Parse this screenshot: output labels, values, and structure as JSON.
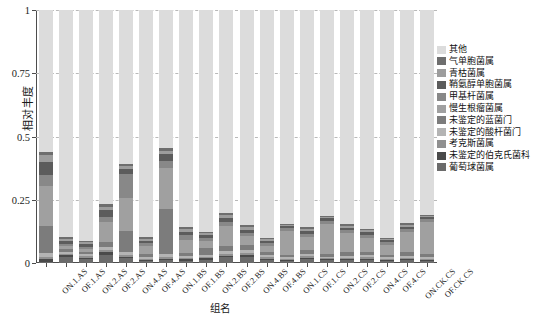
{
  "chart_data": {
    "type": "bar",
    "stacked": true,
    "title": "",
    "xlabel": "组名",
    "ylabel": "相对丰度",
    "ylim": [
      0,
      1
    ],
    "yticks": [
      0,
      0.25,
      0.5,
      0.75,
      1
    ],
    "ytick_labels": [
      "0",
      "0.25",
      "0.5",
      "0.75",
      "1"
    ],
    "grid": true,
    "grid_style": "dashed-horizontal",
    "legend_position": "right",
    "categories": [
      "ON.1.AS",
      "OF.1.AS",
      "ON.2.AS",
      "OF.2.AS",
      "ON.4.AS",
      "OF.4.AS",
      "ON.1.BS",
      "OF.1.BS",
      "ON.2.BS",
      "OF.2.BS",
      "ON.4.BS",
      "OF.4.BS",
      "ON.1.CS",
      "OF.1.CS",
      "ON.2.CS",
      "OF.2.CS",
      "ON.4.CS",
      "OF.4.CS",
      "ON.CK.CS",
      "OF.CK.CS"
    ],
    "series": [
      {
        "name": "葡萄球菌属",
        "color": "#6b6b6b",
        "values": [
          0.004,
          0.022,
          0.014,
          0.03,
          0.018,
          0.006,
          0.01,
          0.008,
          0.012,
          0.022,
          0.024,
          0.01,
          0.008,
          0.014,
          0.01,
          0.01,
          0.01,
          0.008,
          0.01,
          0.008
        ]
      },
      {
        "name": "未鉴定的伯克氏菌科",
        "color": "#4a4a4a",
        "values": [
          0.01,
          0.008,
          0.006,
          0.012,
          0.006,
          0.004,
          0.006,
          0.006,
          0.006,
          0.006,
          0.008,
          0.006,
          0.004,
          0.006,
          0.004,
          0.004,
          0.006,
          0.004,
          0.004,
          0.004
        ]
      },
      {
        "name": "考克斯菌属",
        "color": "#909090",
        "values": [
          0.01,
          0.006,
          0.006,
          0.01,
          0.008,
          0.006,
          0.008,
          0.006,
          0.006,
          0.008,
          0.008,
          0.006,
          0.004,
          0.006,
          0.004,
          0.006,
          0.006,
          0.004,
          0.006,
          0.004
        ]
      },
      {
        "name": "未鉴定的酸杆菌门",
        "color": "#b4b4b4",
        "values": [
          0.016,
          0.008,
          0.008,
          0.012,
          0.01,
          0.008,
          0.01,
          0.008,
          0.008,
          0.01,
          0.01,
          0.008,
          0.006,
          0.008,
          0.006,
          0.008,
          0.008,
          0.006,
          0.008,
          0.006
        ]
      },
      {
        "name": "未鉴定的蓝菌门",
        "color": "#7c7c7c",
        "values": [
          0.105,
          0.01,
          0.008,
          0.02,
          0.084,
          0.012,
          0.18,
          0.012,
          0.026,
          0.02,
          0.02,
          0.014,
          0.01,
          0.016,
          0.012,
          0.014,
          0.014,
          0.01,
          0.014,
          0.012
        ]
      },
      {
        "name": "慢生根瘤菌属",
        "color": "#a0a0a0",
        "values": [
          0.16,
          0.012,
          0.014,
          0.078,
          0.13,
          0.03,
          0.162,
          0.052,
          0.028,
          0.08,
          0.036,
          0.024,
          0.095,
          0.052,
          0.12,
          0.075,
          0.055,
          0.04,
          0.08,
          0.13
        ]
      },
      {
        "name": "甲基杆菌属",
        "color": "#888888",
        "values": [
          0.045,
          0.008,
          0.008,
          0.022,
          0.096,
          0.012,
          0.028,
          0.018,
          0.014,
          0.018,
          0.014,
          0.01,
          0.01,
          0.014,
          0.012,
          0.012,
          0.012,
          0.01,
          0.012,
          0.01
        ]
      },
      {
        "name": "鞘氨醇单胞菌属",
        "color": "#5c5c5c",
        "values": [
          0.05,
          0.014,
          0.01,
          0.024,
          0.018,
          0.01,
          0.026,
          0.014,
          0.01,
          0.016,
          0.012,
          0.008,
          0.008,
          0.012,
          0.01,
          0.01,
          0.01,
          0.008,
          0.01,
          0.008
        ]
      },
      {
        "name": "青枯菌属",
        "color": "#9d9d9d",
        "values": [
          0.028,
          0.008,
          0.008,
          0.014,
          0.012,
          0.008,
          0.014,
          0.01,
          0.008,
          0.01,
          0.01,
          0.008,
          0.006,
          0.008,
          0.006,
          0.008,
          0.008,
          0.006,
          0.008,
          0.006
        ]
      },
      {
        "name": "气单胞菌属",
        "color": "#6e6e6e",
        "values": [
          0.012,
          0.006,
          0.006,
          0.01,
          0.008,
          0.006,
          0.01,
          0.008,
          0.006,
          0.008,
          0.008,
          0.006,
          0.004,
          0.006,
          0.004,
          0.006,
          0.006,
          0.004,
          0.006,
          0.004
        ]
      },
      {
        "name": "其他",
        "color": "#dcdcdc",
        "values": [
          0.56,
          0.898,
          0.912,
          0.768,
          0.61,
          0.898,
          0.546,
          0.858,
          0.876,
          0.802,
          0.85,
          0.9,
          0.845,
          0.858,
          0.812,
          0.847,
          0.865,
          0.9,
          0.842,
          0.808
        ]
      }
    ]
  },
  "axis": {
    "y_title": "相对丰度",
    "x_title": "组名"
  },
  "legend": {
    "items": [
      {
        "label": "其他",
        "color": "#dcdcdc"
      },
      {
        "label": "气单胞菌属",
        "color": "#6e6e6e"
      },
      {
        "label": "青枯菌属",
        "color": "#9d9d9d"
      },
      {
        "label": "鞘氨醇单胞菌属",
        "color": "#5c5c5c"
      },
      {
        "label": "甲基杆菌属",
        "color": "#888888"
      },
      {
        "label": "慢生根瘤菌属",
        "color": "#a0a0a0"
      },
      {
        "label": "未鉴定的蓝菌门",
        "color": "#7c7c7c"
      },
      {
        "label": "未鉴定的酸杆菌门",
        "color": "#b4b4b4"
      },
      {
        "label": "考克斯菌属",
        "color": "#909090"
      },
      {
        "label": "未鉴定的伯克氏菌科",
        "color": "#4a4a4a"
      },
      {
        "label": "葡萄球菌属",
        "color": "#6b6b6b"
      }
    ]
  }
}
